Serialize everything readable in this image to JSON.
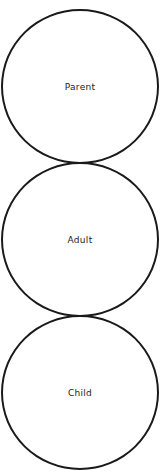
{
  "diagram": {
    "type": "stacked-circles",
    "stroke_color": "#1a1a1a",
    "background": "#ffffff",
    "nodes": [
      {
        "id": "parent",
        "label": "Parent"
      },
      {
        "id": "adult",
        "label": "Adult"
      },
      {
        "id": "child",
        "label": "Child"
      }
    ]
  }
}
